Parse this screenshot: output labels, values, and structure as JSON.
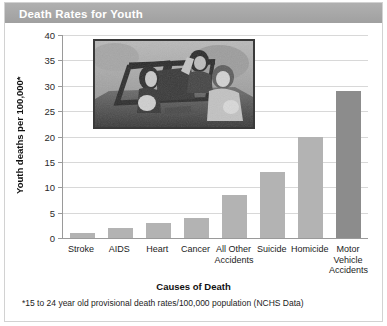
{
  "header": {
    "title": "Death Rates for Youth"
  },
  "footnote": "*15 to 24 year old provisional death rates/100,000 population (NCHS Data)",
  "photo": {
    "alt": "Black and white photograph of young people riding in an open convertible car",
    "name": "teens-in-convertible-photo"
  },
  "colors": {
    "title_bar": "#a8a8a8",
    "title_text": "#ffffff",
    "bar_light": "#b3b3b3",
    "bar_dark": "#8c8c8c",
    "gridline": "#d8d8d8",
    "axis": "#9a9a9a",
    "frame": "#d2d2d2"
  },
  "chart_data": {
    "type": "bar",
    "title": "Death Rates for Youth",
    "xlabel": "Causes of Death",
    "ylabel": "Youth deaths per 100,000*",
    "ylim": [
      0,
      40
    ],
    "yticks": [
      0,
      5,
      10,
      15,
      20,
      25,
      30,
      35,
      40
    ],
    "ytick_labels": [
      "0",
      "5",
      "10",
      "15",
      "20",
      "25",
      "30",
      "35",
      "40"
    ],
    "grid": true,
    "legend": false,
    "categories": [
      "Stroke",
      "AIDS",
      "Heart",
      "Cancer",
      "All Other Accidents",
      "Suicide",
      "Homicide",
      "Motor Vehicle Accidents"
    ],
    "category_lines": [
      [
        "Stroke"
      ],
      [
        "AIDS"
      ],
      [
        "Heart"
      ],
      [
        "Cancer"
      ],
      [
        "All Other",
        "Accidents"
      ],
      [
        "Suicide"
      ],
      [
        "Homicide"
      ],
      [
        "Motor",
        "Vehicle",
        "Accidents"
      ]
    ],
    "values": [
      1,
      2,
      3,
      4,
      8.5,
      13,
      20,
      29
    ],
    "bar_colors": [
      "#b3b3b3",
      "#b3b3b3",
      "#b3b3b3",
      "#b3b3b3",
      "#b3b3b3",
      "#b3b3b3",
      "#b3b3b3",
      "#8c8c8c"
    ]
  }
}
